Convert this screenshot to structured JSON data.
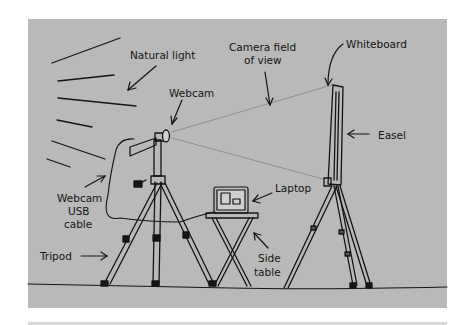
{
  "diagram": {
    "background": "#b9b9b9",
    "ink": "#151515",
    "labels": {
      "natural_light": "Natural light",
      "camera_fov_1": "Camera field",
      "camera_fov_2": "of view",
      "whiteboard": "Whiteboard",
      "webcam": "Webcam",
      "easel": "Easel",
      "usb_1": "Webcam",
      "usb_2": "USB",
      "usb_3": "cable",
      "laptop": "Laptop",
      "tripod": "Tripod",
      "side_1": "Side",
      "side_2": "table"
    }
  }
}
